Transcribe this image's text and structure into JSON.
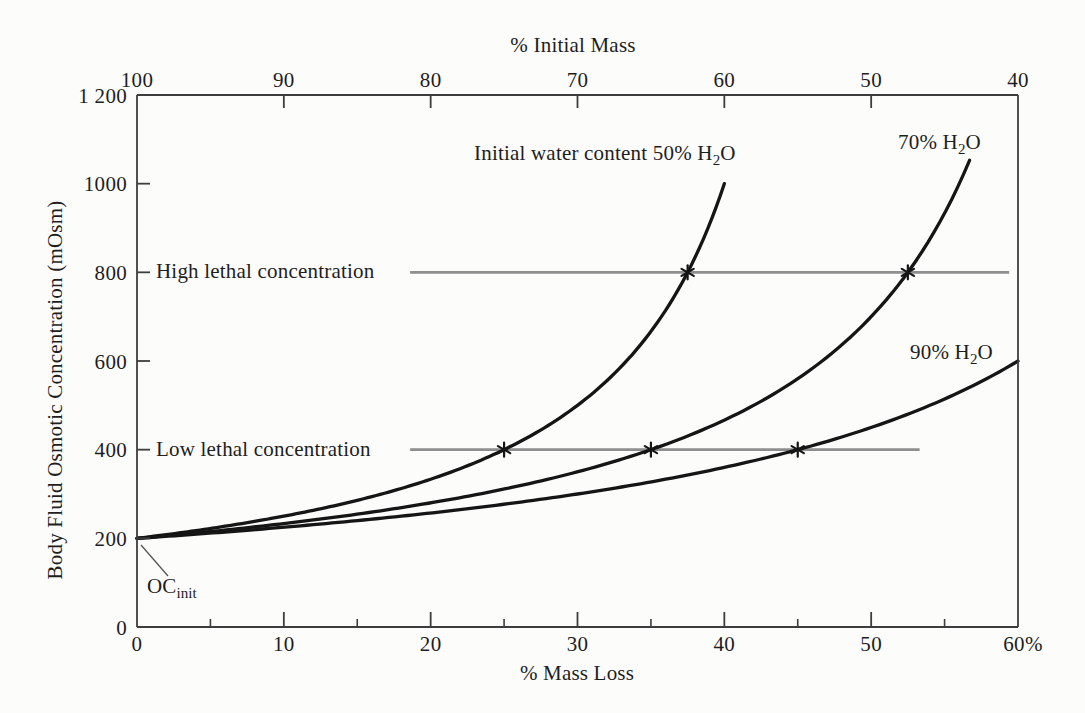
{
  "colors": {
    "background": "#fcfcfa",
    "axis": "#3d3d3d",
    "curve": "#151515",
    "reference_line": "#8e8e8e",
    "text": "#1e1e1e"
  },
  "chart_data": {
    "type": "line",
    "title": "",
    "grid": false,
    "legend_position": "none",
    "marker_glyph": "*",
    "top_axis": {
      "label": "% Initial Mass",
      "ticks": [
        "100",
        "90",
        "80",
        "70",
        "60",
        "50",
        "40"
      ],
      "tick_values": [
        100,
        90,
        80,
        70,
        60,
        50,
        40
      ],
      "range": [
        100,
        40
      ]
    },
    "bottom_axis": {
      "label": "% Mass Loss",
      "ticks": [
        "0",
        "10",
        "20",
        "30",
        "40",
        "50",
        "60%"
      ],
      "tick_values": [
        0,
        10,
        20,
        30,
        40,
        50,
        60
      ],
      "minor_tick_values": [
        5,
        15,
        25,
        35,
        45,
        55
      ],
      "range": [
        0,
        60
      ]
    },
    "left_axis": {
      "label": "Body Fluid Osmotic Concentration (mOsm)",
      "ticks": [
        "0",
        "200",
        "400",
        "600",
        "800",
        "1000",
        "1 200"
      ],
      "tick_values": [
        0,
        200,
        400,
        600,
        800,
        1000,
        1200
      ],
      "range": [
        0,
        1200
      ]
    },
    "initial_osmotic_concentration": 200,
    "series": [
      {
        "name": "50% H2O",
        "water_content_pct": 50,
        "mass_loss_end_pct": 40,
        "label": {
          "pre": "Initial water content 50% H",
          "sub": "2",
          "post": "O"
        },
        "points": [
          [
            0,
            200
          ],
          [
            5,
            222
          ],
          [
            10,
            250
          ],
          [
            15,
            286
          ],
          [
            20,
            333
          ],
          [
            25,
            400
          ],
          [
            30,
            500
          ],
          [
            35,
            667
          ],
          [
            37.5,
            800
          ],
          [
            40,
            1000
          ]
        ]
      },
      {
        "name": "70% H2O",
        "water_content_pct": 70,
        "mass_loss_end_pct": 56.7,
        "label": {
          "pre": "70% H",
          "sub": "2",
          "post": "O"
        },
        "points": [
          [
            0,
            200
          ],
          [
            5,
            215
          ],
          [
            10,
            233
          ],
          [
            15,
            255
          ],
          [
            20,
            280
          ],
          [
            25,
            311
          ],
          [
            30,
            350
          ],
          [
            35,
            400
          ],
          [
            40,
            467
          ],
          [
            45,
            560
          ],
          [
            50,
            700
          ],
          [
            52.5,
            800
          ],
          [
            55,
            933
          ],
          [
            56.7,
            1050
          ]
        ]
      },
      {
        "name": "90% H2O",
        "water_content_pct": 90,
        "mass_loss_end_pct": 60,
        "label": {
          "pre": "90% H",
          "sub": "2",
          "post": "O"
        },
        "points": [
          [
            0,
            200
          ],
          [
            5,
            212
          ],
          [
            10,
            225
          ],
          [
            15,
            240
          ],
          [
            20,
            257
          ],
          [
            25,
            277
          ],
          [
            30,
            300
          ],
          [
            35,
            327
          ],
          [
            40,
            360
          ],
          [
            45,
            400
          ],
          [
            50,
            450
          ],
          [
            55,
            514
          ],
          [
            60,
            600
          ]
        ]
      }
    ],
    "reference_lines": [
      {
        "name": "high-lethal",
        "label": "High lethal concentration",
        "value": 800,
        "from_pct": 18.6,
        "to_pct": 59.4,
        "marker_mass_loss_pct": [
          37.5,
          52.5
        ]
      },
      {
        "name": "low-lethal",
        "label": "Low lethal concentration",
        "value": 400,
        "from_pct": 18.6,
        "to_pct": 53.3,
        "marker_mass_loss_pct": [
          25,
          35,
          45
        ]
      }
    ],
    "annotations": {
      "oc_init": {
        "main": "OC",
        "sub": "init"
      }
    }
  }
}
